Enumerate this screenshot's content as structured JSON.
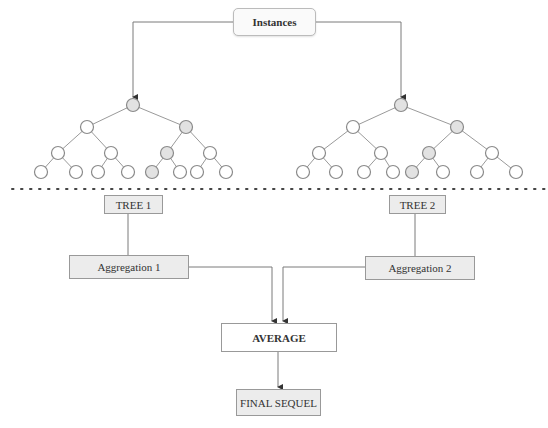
{
  "diagram": {
    "source": {
      "label": "Instances"
    },
    "trees": [
      {
        "label": "TREE 1",
        "aggregation_label": "Aggregation 1",
        "nodes": [
          {
            "id": 0,
            "x": 133,
            "y": 105,
            "highlight": true
          },
          {
            "id": 1,
            "x": 87,
            "y": 127,
            "highlight": false
          },
          {
            "id": 2,
            "x": 186,
            "y": 127,
            "highlight": true
          },
          {
            "id": 3,
            "x": 58,
            "y": 153,
            "highlight": false
          },
          {
            "id": 4,
            "x": 111,
            "y": 153,
            "highlight": false
          },
          {
            "id": 5,
            "x": 167,
            "y": 153,
            "highlight": true
          },
          {
            "id": 6,
            "x": 210,
            "y": 153,
            "highlight": false
          },
          {
            "id": 7,
            "x": 41,
            "y": 172,
            "highlight": false
          },
          {
            "id": 8,
            "x": 76,
            "y": 172,
            "highlight": false
          },
          {
            "id": 9,
            "x": 98,
            "y": 172,
            "highlight": false
          },
          {
            "id": 10,
            "x": 128,
            "y": 172,
            "highlight": false
          },
          {
            "id": 11,
            "x": 152,
            "y": 172,
            "highlight": true
          },
          {
            "id": 12,
            "x": 180,
            "y": 172,
            "highlight": false
          },
          {
            "id": 13,
            "x": 197,
            "y": 172,
            "highlight": false
          },
          {
            "id": 14,
            "x": 226,
            "y": 172,
            "highlight": false
          }
        ],
        "edges": [
          [
            0,
            1
          ],
          [
            0,
            2
          ],
          [
            1,
            3
          ],
          [
            1,
            4
          ],
          [
            2,
            5
          ],
          [
            2,
            6
          ],
          [
            3,
            7
          ],
          [
            3,
            8
          ],
          [
            4,
            9
          ],
          [
            4,
            10
          ],
          [
            5,
            11
          ],
          [
            5,
            12
          ],
          [
            6,
            13
          ],
          [
            6,
            14
          ]
        ]
      },
      {
        "label": "TREE 2",
        "aggregation_label": "Aggregation 2",
        "nodes": [
          {
            "id": 0,
            "x": 401,
            "y": 105,
            "highlight": true
          },
          {
            "id": 1,
            "x": 353,
            "y": 127,
            "highlight": false
          },
          {
            "id": 2,
            "x": 457,
            "y": 127,
            "highlight": true
          },
          {
            "id": 3,
            "x": 319,
            "y": 153,
            "highlight": false
          },
          {
            "id": 4,
            "x": 381,
            "y": 153,
            "highlight": false
          },
          {
            "id": 5,
            "x": 429,
            "y": 153,
            "highlight": true
          },
          {
            "id": 6,
            "x": 492,
            "y": 153,
            "highlight": false
          },
          {
            "id": 7,
            "x": 303,
            "y": 172,
            "highlight": false
          },
          {
            "id": 8,
            "x": 336,
            "y": 172,
            "highlight": false
          },
          {
            "id": 9,
            "x": 364,
            "y": 172,
            "highlight": false
          },
          {
            "id": 10,
            "x": 393,
            "y": 172,
            "highlight": false
          },
          {
            "id": 11,
            "x": 412,
            "y": 172,
            "highlight": true
          },
          {
            "id": 12,
            "x": 443,
            "y": 172,
            "highlight": false
          },
          {
            "id": 13,
            "x": 477,
            "y": 172,
            "highlight": false
          },
          {
            "id": 14,
            "x": 516,
            "y": 172,
            "highlight": false
          }
        ],
        "edges": [
          [
            0,
            1
          ],
          [
            0,
            2
          ],
          [
            1,
            3
          ],
          [
            1,
            4
          ],
          [
            2,
            5
          ],
          [
            2,
            6
          ],
          [
            3,
            7
          ],
          [
            3,
            8
          ],
          [
            4,
            9
          ],
          [
            4,
            10
          ],
          [
            5,
            11
          ],
          [
            5,
            12
          ],
          [
            6,
            13
          ],
          [
            6,
            14
          ]
        ]
      }
    ],
    "average_label": "AVERAGE",
    "output_label": "FINAL SEQUEL",
    "colors": {
      "line": "#7a7a7a",
      "node_stroke": "#8a8a8a",
      "node_fill": "#ffffff",
      "node_highlight_fill": "#e2e2e2",
      "box_fill": "#ececec",
      "dots": "#444444"
    }
  }
}
